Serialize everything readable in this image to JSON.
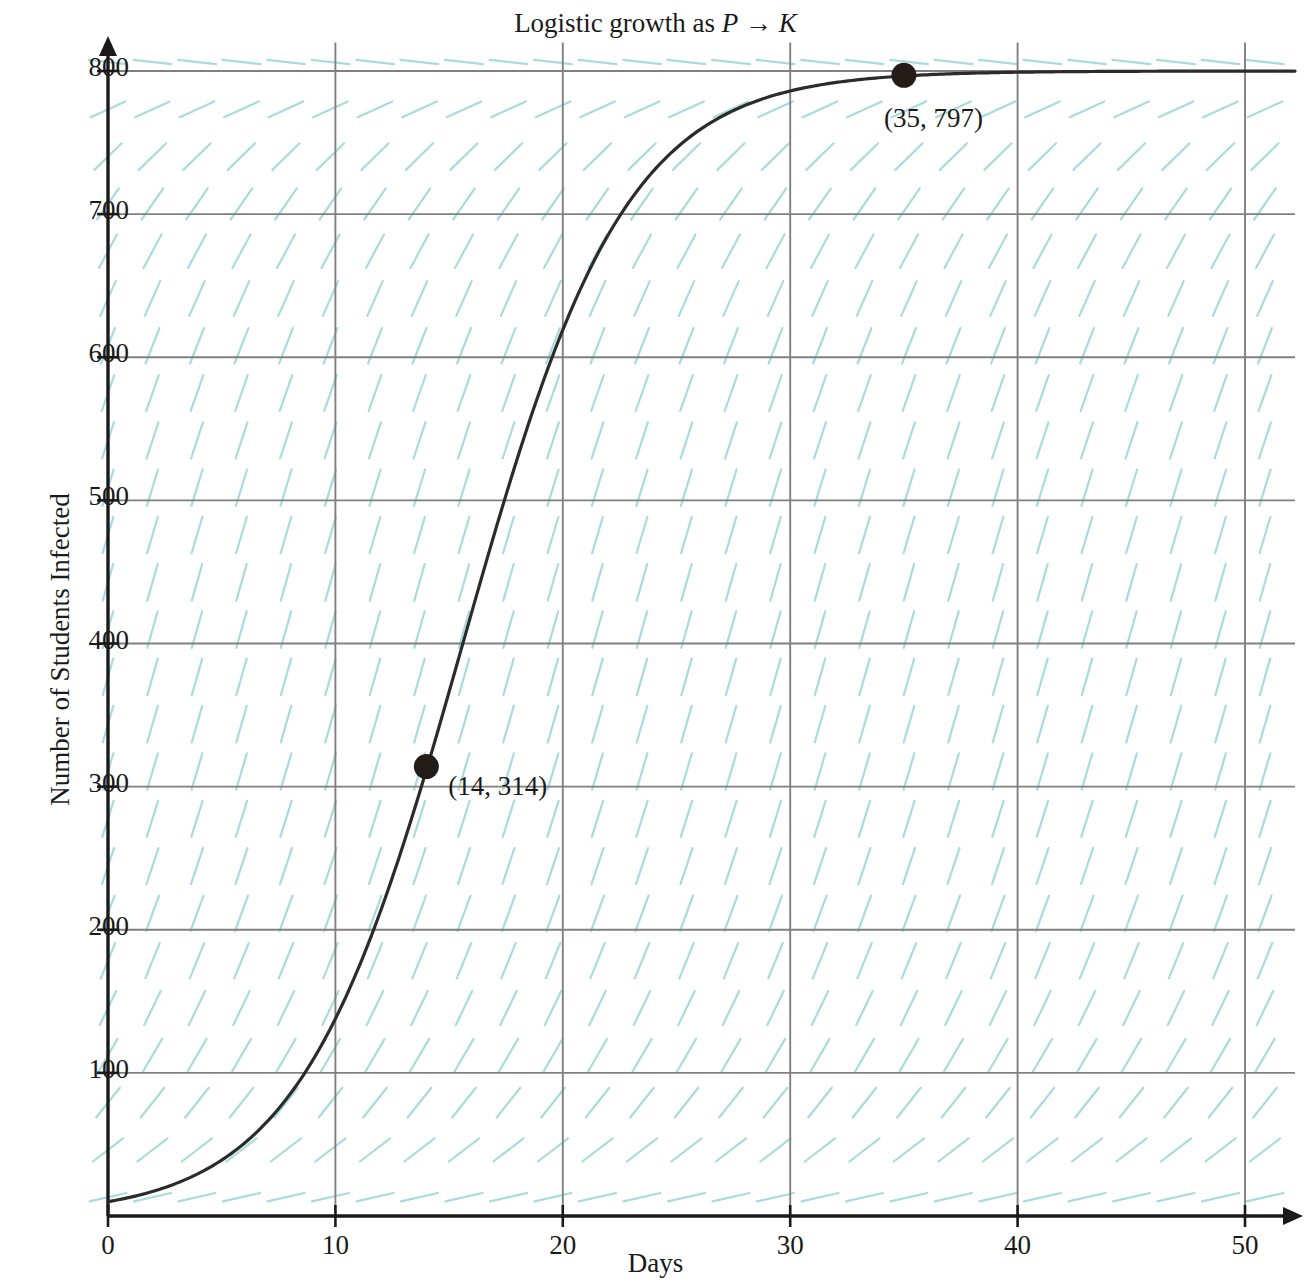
{
  "chart_data": {
    "type": "line",
    "title": "Logistic growth as P → K",
    "title_plain": "Logistic growth as ",
    "title_var1": "P",
    "title_arrow": " → ",
    "title_var2": "K",
    "xlabel": "Days",
    "ylabel": "Number of Students Infected",
    "xlim": [
      0,
      52
    ],
    "ylim": [
      0,
      820
    ],
    "xticks": [
      0,
      10,
      20,
      30,
      40,
      50
    ],
    "xticklabels": [
      "0",
      "10",
      "20",
      "30",
      "40",
      "50"
    ],
    "yticks": [
      100,
      200,
      300,
      400,
      500,
      600,
      700,
      800
    ],
    "yticklabels": [
      "100",
      "200",
      "300",
      "400",
      "500",
      "600",
      "700",
      "800"
    ],
    "grid": true,
    "grid_color": "#808080",
    "axis_color": "#1a1a1a",
    "curve_color": "#2b2b2b",
    "slopefield_color": "#a8dcdc",
    "legend": null,
    "carrying_capacity": 800,
    "growth_rate": 0.28,
    "initial_value": 10,
    "annotations": [
      {
        "label": "(14, 314)",
        "x": 14,
        "y": 314,
        "marker": "filled-circle"
      },
      {
        "label": "(35, 797)",
        "x": 35,
        "y": 797,
        "marker": "filled-circle"
      }
    ],
    "series": [
      {
        "name": "Logistic solution",
        "x": [
          0,
          1,
          2,
          3,
          4,
          5,
          6,
          7,
          8,
          9,
          10,
          11,
          12,
          13,
          14,
          15,
          16,
          17,
          18,
          19,
          20,
          21,
          22,
          23,
          24,
          25,
          26,
          27,
          28,
          29,
          30,
          31,
          32,
          33,
          34,
          35,
          36,
          37,
          38,
          39,
          40,
          41,
          42,
          43,
          44,
          45,
          46,
          47,
          48,
          49,
          50,
          51,
          52
        ],
        "values": [
          10,
          13,
          18,
          23,
          30,
          40,
          52,
          68,
          88,
          113,
          145,
          184,
          232,
          290,
          356,
          430,
          508,
          584,
          654,
          713,
          760,
          795,
          820,
          838,
          850,
          858,
          863,
          866,
          868,
          869,
          870,
          870,
          870,
          871,
          871,
          871,
          871,
          871,
          871,
          871,
          871,
          871,
          871,
          871,
          871,
          871,
          871,
          871,
          871,
          871,
          871,
          871,
          871
        ]
      }
    ]
  }
}
